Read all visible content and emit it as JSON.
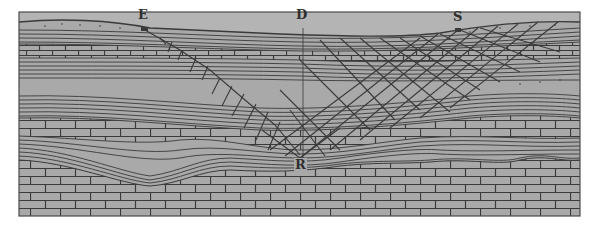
{
  "figure": {
    "type": "geological-cross-section",
    "colors": {
      "page": "#ffffff",
      "panel": "#a9a9a9",
      "sky": "#b4b4b4",
      "ink": "#3a3a3a"
    },
    "labels": {
      "E": "E",
      "D": "D",
      "S": "S",
      "R": "R"
    },
    "label_positions": {
      "E": {
        "x": 138,
        "y": 10
      },
      "D": {
        "x": 296,
        "y": 10
      },
      "S": {
        "x": 453,
        "y": 11
      },
      "R": {
        "x": 294,
        "y": 160
      }
    },
    "strata": [
      {
        "name": "surface-soil",
        "pattern": "dotted"
      },
      {
        "name": "upper-shale",
        "pattern": "lines"
      },
      {
        "name": "upper-limestone",
        "pattern": "brick"
      },
      {
        "name": "middle-shale",
        "pattern": "lines"
      },
      {
        "name": "sandstone",
        "pattern": "blank"
      },
      {
        "name": "lower-shale",
        "pattern": "lines"
      },
      {
        "name": "lower-limestone",
        "pattern": "brick"
      },
      {
        "name": "basal-shale",
        "pattern": "wavy-lines"
      },
      {
        "name": "bedrock-limestone",
        "pattern": "brick"
      }
    ],
    "features": [
      {
        "name": "fissure-E-to-R",
        "from": "E",
        "to": "R"
      },
      {
        "name": "fracture-zone-S-to-R",
        "from": "S",
        "to": "R"
      },
      {
        "name": "vertical-line-D",
        "at": "D"
      }
    ]
  }
}
